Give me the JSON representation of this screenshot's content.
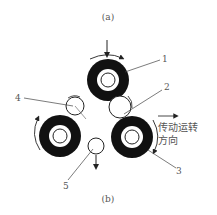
{
  "caption_top": "(a)",
  "caption_bottom": "(b)",
  "labels": {
    "n1": "1",
    "n2": "2",
    "n3": "3",
    "n4": "4",
    "n5": "5"
  },
  "direction_text_line1": "传动运转",
  "direction_text_line2": "方向",
  "colors": {
    "ink": "#111111",
    "text": "#555555",
    "background": "#ffffff"
  }
}
